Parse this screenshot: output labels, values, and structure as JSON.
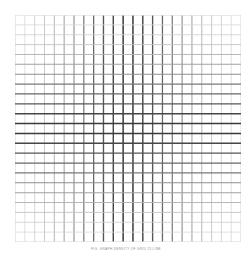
{
  "figure": {
    "caption": "FIG. GRAPH DENSITY OF GRID 23 LINE",
    "caption_color": "#8e8e8e",
    "background_color": "#ffffff"
  },
  "plot": {
    "left": 15,
    "top": 15,
    "width": 226,
    "height": 227
  },
  "chart_data": {
    "type": "heatmap",
    "title": "",
    "subtitle": "",
    "xlabel": "",
    "ylabel": "",
    "grid": true,
    "legend": false,
    "legend_position": "none",
    "n_columns": 23,
    "n_rows": 23,
    "n_vertical_lines": 24,
    "n_horizontal_lines": 24,
    "cell_width": 9.83,
    "cell_height": 9.87,
    "xlim": [
      0,
      23
    ],
    "ylim": [
      0,
      23
    ],
    "x": [
      0,
      1,
      2,
      3,
      4,
      5,
      6,
      7,
      8,
      9,
      10,
      11,
      12,
      13,
      14,
      15,
      16,
      17,
      18,
      19,
      20,
      21,
      22,
      23
    ],
    "y": [
      0,
      1,
      2,
      3,
      4,
      5,
      6,
      7,
      8,
      9,
      10,
      11,
      12,
      13,
      14,
      15,
      16,
      17,
      18,
      19,
      20,
      21,
      22,
      23
    ],
    "xtick_labels": [],
    "ytick_labels": [],
    "center_index": 11.5,
    "color_min": "#e8e8e8",
    "color_max": "#3a3a3a",
    "line_width_min": 0.7,
    "line_width_max": 1.5,
    "falloff": "gaussian",
    "falloff_sigma": 6.2,
    "series": [
      {
        "name": "vertical line darkness",
        "values": [
          0.06,
          0.1,
          0.15,
          0.22,
          0.31,
          0.41,
          0.52,
          0.64,
          0.74,
          0.84,
          0.93,
          1.0,
          1.0,
          0.93,
          0.84,
          0.74,
          0.64,
          0.52,
          0.41,
          0.31,
          0.22,
          0.15,
          0.1,
          0.06
        ]
      },
      {
        "name": "horizontal line darkness",
        "values": [
          0.06,
          0.1,
          0.15,
          0.22,
          0.31,
          0.41,
          0.52,
          0.64,
          0.74,
          0.84,
          0.93,
          1.0,
          1.0,
          0.93,
          0.84,
          0.74,
          0.64,
          0.52,
          0.41,
          0.31,
          0.22,
          0.15,
          0.1,
          0.06
        ]
      }
    ],
    "annotations": []
  }
}
